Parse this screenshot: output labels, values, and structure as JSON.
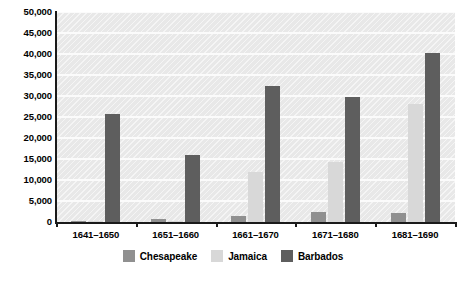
{
  "chart_data": {
    "type": "bar",
    "title": "",
    "subtitle": "",
    "xlabel": "",
    "ylabel": "",
    "grid": true,
    "legend_position": "bottom",
    "ylim": [
      0,
      50000
    ],
    "ytick_labels": [
      "50,000",
      "45,000",
      "40,000",
      "35,000",
      "30,000",
      "25,000",
      "20,000",
      "15,000",
      "10,000",
      "5,000",
      "0"
    ],
    "ytick_values": [
      50000,
      45000,
      40000,
      35000,
      30000,
      25000,
      20000,
      15000,
      10000,
      5000,
      0
    ],
    "categories": [
      "1641–1650",
      "1651–1660",
      "1661–1670",
      "1671–1680",
      "1681–1690"
    ],
    "series": [
      {
        "name": "Chesapeake",
        "color": "#909090",
        "values": [
          200,
          700,
          1400,
          2400,
          2200
        ]
      },
      {
        "name": "Jamaica",
        "color": "#d8d8d8",
        "values": [
          100,
          300,
          12000,
          14400,
          28000
        ]
      },
      {
        "name": "Barbados",
        "color": "#5e5e5e",
        "values": [
          25700,
          16000,
          32300,
          29700,
          40200
        ]
      }
    ]
  },
  "legend": {
    "entries": [
      {
        "label": "Chesapeake",
        "color": "#909090"
      },
      {
        "label": "Jamaica",
        "color": "#d8d8d8"
      },
      {
        "label": "Barbados",
        "color": "#5e5e5e"
      }
    ]
  },
  "colors": {
    "plot_background": "#e8e8e8",
    "gridline": "#fbfbfb",
    "axis": "#1a1a1a",
    "text": "#000000"
  }
}
